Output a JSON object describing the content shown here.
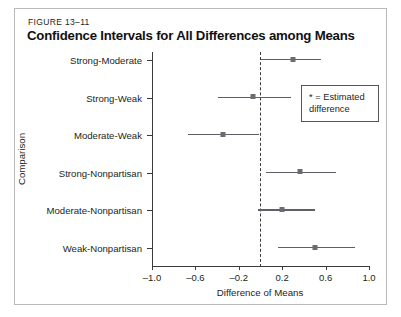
{
  "figure": {
    "number": "FIGURE 13–11",
    "title": "Confidence Intervals for All Differences among Means"
  },
  "legend": {
    "text": "* = Estimated difference"
  },
  "chart_data": {
    "type": "scatter",
    "title": "Confidence Intervals for All Differences among Means",
    "xlabel": "Difference of Means",
    "ylabel": "Comparison",
    "xlim": [
      -1.0,
      1.0
    ],
    "xticks": [
      "-1.0",
      "-0.6",
      "-0.2",
      "0.2",
      "0.6",
      "1.0"
    ],
    "xtick_values": [
      -1.0,
      -0.6,
      -0.2,
      0.2,
      0.6,
      1.0
    ],
    "grid": false,
    "reference_line": 0.0,
    "reference_line_style": "dashed",
    "marker_label": "* = Estimated difference",
    "categories": [
      "Strong-Moderate",
      "Strong-Weak",
      "Moderate-Weak",
      "Strong-Nonpartisan",
      "Moderate-Nonpartisan",
      "Weak-Nonpartisan"
    ],
    "estimates": [
      0.3,
      -0.07,
      -0.35,
      0.36,
      0.2,
      0.5
    ],
    "lower": [
      0.0,
      -0.39,
      -0.67,
      0.05,
      -0.02,
      0.16
    ],
    "upper": [
      0.56,
      0.28,
      -0.01,
      0.7,
      0.5,
      0.87
    ],
    "rows": [
      {
        "category": "Strong-Moderate",
        "lower": 0.0,
        "estimate": 0.3,
        "upper": 0.56
      },
      {
        "category": "Strong-Weak",
        "lower": -0.39,
        "estimate": -0.07,
        "upper": 0.28
      },
      {
        "category": "Moderate-Weak",
        "lower": -0.67,
        "estimate": -0.35,
        "upper": -0.01
      },
      {
        "category": "Strong-Nonpartisan",
        "lower": 0.05,
        "estimate": 0.36,
        "upper": 0.7
      },
      {
        "category": "Moderate-Nonpartisan",
        "lower": -0.02,
        "estimate": 0.2,
        "upper": 0.5
      },
      {
        "category": "Weak-Nonpartisan",
        "lower": 0.16,
        "estimate": 0.5,
        "upper": 0.87
      }
    ]
  },
  "colors": {
    "interval": "#5f5f66",
    "marker": "#6b6b73",
    "axis": "#3a3a3a",
    "text": "#231f20",
    "frame": "#b9b9b9"
  }
}
